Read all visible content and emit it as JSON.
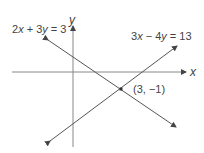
{
  "diagram": {
    "type": "coordinate-plane",
    "axes": {
      "x_label": "x",
      "y_label": "y"
    },
    "lines": [
      {
        "equation": "2x + 3y = 3",
        "label_parts": [
          "2",
          "x",
          " + 3",
          "y",
          " = 3"
        ]
      },
      {
        "equation": "3x − 4y = 13",
        "label_parts": [
          "3",
          "x",
          " − 4",
          "y",
          " = 13"
        ]
      }
    ],
    "intersection": {
      "label": "(3, −1)"
    },
    "colors": {
      "line": "#555555",
      "axis": "#777777",
      "text": "#444444"
    }
  }
}
